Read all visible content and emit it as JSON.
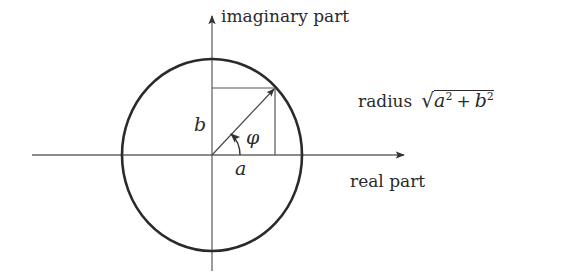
{
  "diagram": {
    "axes": {
      "x_label": "real part",
      "y_label": "imaginary part"
    },
    "labels": {
      "radius_text": "radius",
      "radius_expr_a": "a",
      "radius_expr_plus": "+",
      "radius_expr_b": "b",
      "radius_expr_exp": "2",
      "sqrt_symbol": "√",
      "a": "a",
      "b": "b",
      "phi": "φ"
    },
    "colors": {
      "stroke": "#2a2a2a",
      "axis": "#555555",
      "background": "#ffffff"
    },
    "geometry": {
      "origin": [
        212,
        155
      ],
      "circle_rx": 90,
      "circle_ry": 96,
      "point": [
        275,
        88
      ]
    }
  }
}
